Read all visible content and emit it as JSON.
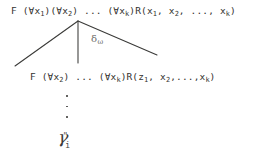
{
  "document": {
    "kind": "logic-derivation-tree",
    "background_color": "#ffffff",
    "ink_color": "#35332f"
  },
  "tree": {
    "root_formula": {
      "prefix_symbol": "F",
      "text": "F  (∀x1)(∀x2)  ...  (∀xk)R(x1, x2, ..., xk)",
      "parts": [
        {
          "base": "F",
          "sub": ""
        },
        {
          "base": "  (∀x",
          "sub": "1"
        },
        {
          "base": ")(∀x",
          "sub": "2"
        },
        {
          "base": ")  ...  (∀x",
          "sub": "k"
        },
        {
          "base": ")R(x",
          "sub": "1"
        },
        {
          "base": ",  x",
          "sub": "2"
        },
        {
          "base": ",  ...,  x",
          "sub": "k"
        },
        {
          "base": ")",
          "sub": ""
        }
      ]
    },
    "child_formula": {
      "prefix_symbol": "F",
      "text": "F  (∀x2)  ...  (∀xk)R(z1, x2,...,xk)",
      "parts": [
        {
          "base": "F",
          "sub": ""
        },
        {
          "base": "  (∀x",
          "sub": "2"
        },
        {
          "base": ")  ...  (∀x",
          "sub": "k"
        },
        {
          "base": ")R(z",
          "sub": "1"
        },
        {
          "base": ",  x",
          "sub": "2"
        },
        {
          "base": ",...,x",
          "sub": "k"
        },
        {
          "base": ")",
          "sub": ""
        }
      ]
    },
    "rule_label": {
      "symbol": "δ",
      "subscript": "ω"
    },
    "branches": [
      {
        "name": "left-branch",
        "x1": 78,
        "y1": 21,
        "x2": 15,
        "y2": 66
      },
      {
        "name": "middle-branch",
        "x1": 78,
        "y1": 21,
        "x2": 78,
        "y2": 63
      },
      {
        "name": "right-branch",
        "x1": 78,
        "y1": 21,
        "x2": 157,
        "y2": 55
      }
    ],
    "ellipsis": {
      "symbol": "⋮",
      "dot_count": 3
    },
    "leaf_symbol": {
      "glyph": "γ",
      "subscript": "i",
      "prime": "\""
    }
  }
}
